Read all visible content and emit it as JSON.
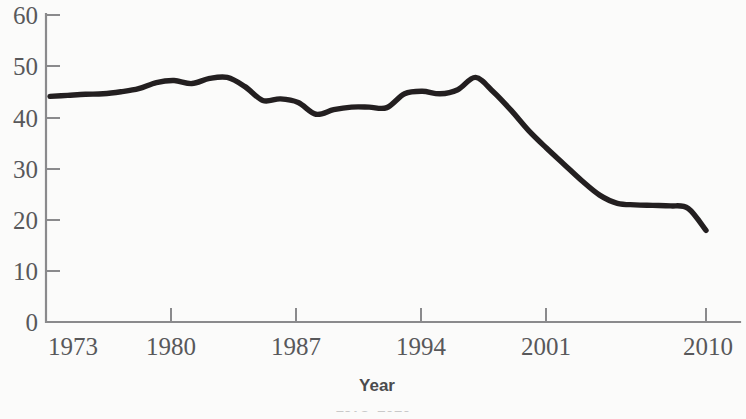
{
  "chart_data": {
    "type": "line",
    "title": "",
    "subtitle": "",
    "xlabel": "Year",
    "ylabel": "",
    "xlim": [
      1973,
      2010
    ],
    "ylim": [
      0,
      60
    ],
    "grid": false,
    "legend": false,
    "legend_position": "none",
    "line_color": "#231f20",
    "axis_color": "#8a8a8c",
    "background_color": "#fbfbfa",
    "xticks": [
      1973,
      1980,
      1987,
      1994,
      2001,
      2010
    ],
    "xtick_labels": [
      "1973",
      "1980",
      "1987",
      "1994",
      "2001",
      "2010"
    ],
    "yticks": [
      0,
      10,
      20,
      30,
      40,
      50,
      60
    ],
    "ytick_labels": [
      "0",
      "10",
      "20",
      "30",
      "40",
      "50",
      "60"
    ],
    "x": [
      1973,
      1974,
      1975,
      1976,
      1977,
      1978,
      1979,
      1980,
      1981,
      1982,
      1983,
      1984,
      1985,
      1986,
      1987,
      1988,
      1989,
      1990,
      1991,
      1992,
      1993,
      1994,
      1995,
      1996,
      1997,
      1998,
      1999,
      2000,
      2001,
      2002,
      2003,
      2004,
      2005,
      2006,
      2007,
      2008,
      2009,
      2010
    ],
    "values": [
      44.1,
      44.3,
      44.5,
      44.6,
      45.0,
      45.6,
      46.8,
      47.2,
      46.6,
      47.6,
      47.8,
      46.0,
      43.3,
      43.6,
      42.9,
      40.6,
      41.5,
      42.0,
      42.0,
      41.9,
      44.6,
      45.1,
      44.6,
      45.4,
      47.8,
      45.0,
      41.4,
      37.4,
      34.0,
      30.8,
      27.6,
      24.8,
      23.2,
      22.9,
      22.8,
      22.7,
      22.2,
      17.9
    ],
    "annotations": []
  },
  "axis": {
    "x_title": "Year"
  },
  "caption": {
    "text": "1973–2010"
  }
}
